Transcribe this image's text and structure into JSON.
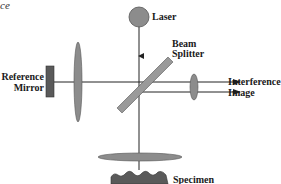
{
  "figure": {
    "caption_fragment": "ce",
    "labels": {
      "laser": "Laser",
      "beam_splitter_line1": "Beam",
      "beam_splitter_line2": "Splitter",
      "reference_mirror_line1": "Reference",
      "reference_mirror_line2": "Mirror",
      "interference_image_line1": "Interference",
      "interference_image_line2": "Image",
      "specimen": "Specimen"
    },
    "colors": {
      "component_fill": "#8c8c8c",
      "mirror_fill": "#5a5a5a",
      "line": "#222222",
      "text": "#1a1a1a"
    }
  }
}
